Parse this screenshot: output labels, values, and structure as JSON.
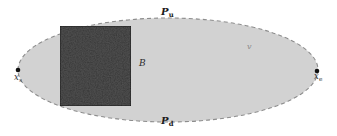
{
  "figure": {
    "background_color": "#ffffff",
    "region": {
      "name": "elliptical-domain",
      "fill_color": "#d2d2d2",
      "border_color": "#8f8f8f",
      "border_style": "dashed",
      "center_x": 168,
      "center_y": 70,
      "radius_x": 150,
      "radius_y": 52
    },
    "block": {
      "name": "textured-block",
      "label": "B",
      "fill_color": "#0d0d0d",
      "texture": "noise",
      "x": 60,
      "y": 26,
      "width": 71,
      "height": 80
    },
    "endpoints": [
      {
        "name": "start-point",
        "label": "x",
        "subscript": "s",
        "cx": 18,
        "cy": 70,
        "color": "#111111"
      },
      {
        "name": "end-point",
        "label": "x",
        "subscript": "e",
        "cx": 317,
        "cy": 71,
        "color": "#111111"
      }
    ],
    "boundaries": [
      {
        "name": "upper-boundary",
        "label": "P",
        "subscript": "u",
        "position": "top"
      },
      {
        "name": "lower-boundary",
        "label": "P",
        "subscript": "d",
        "position": "bottom"
      }
    ],
    "annotations": [
      {
        "name": "block-label",
        "text": "B"
      },
      {
        "name": "velocity-label",
        "text": "v"
      }
    ]
  }
}
